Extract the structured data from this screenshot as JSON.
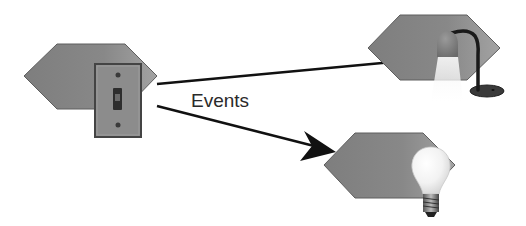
{
  "diagram": {
    "type": "event-flow",
    "label": "Events",
    "colors": {
      "background": "#ffffff",
      "node_fill_dark": "#7e7e7e",
      "node_fill_light": "#a3a3a3",
      "node_stroke": "#5e5e5e",
      "switch_plate": "#8c8c8c",
      "switch_border": "#444444",
      "arrow": "#111111",
      "text": "#2a2a2a"
    },
    "nodes": [
      {
        "id": "switch-node",
        "role": "source",
        "icon": "light-switch-icon"
      },
      {
        "id": "lamp-node",
        "role": "listener",
        "icon": "desk-lamp-icon"
      },
      {
        "id": "bulb-node",
        "role": "listener",
        "icon": "light-bulb-icon"
      }
    ],
    "edges": [
      {
        "from": "switch-node",
        "to": "lamp-node"
      },
      {
        "from": "switch-node",
        "to": "bulb-node"
      }
    ]
  }
}
